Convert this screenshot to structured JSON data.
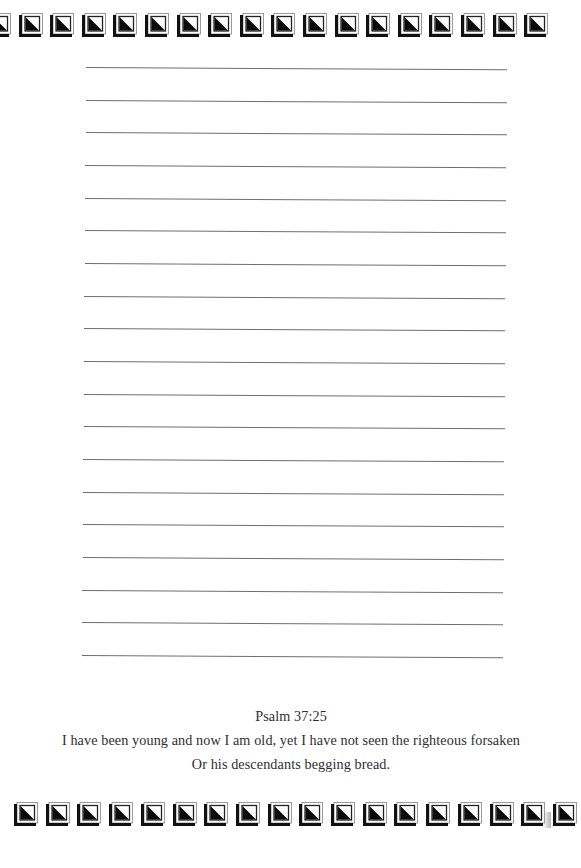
{
  "page": {
    "type": "lined-journal-page",
    "background": "#ffffff",
    "rule_color": "#6e6e6e",
    "text_color": "#2e2e2e"
  },
  "border": {
    "top_tiles": 18,
    "bottom_tiles": 18,
    "tile_icon": "square-with-black-triangle-icon"
  },
  "ruled_lines": {
    "count": 19
  },
  "verse": {
    "reference": "Psalm 37:25",
    "line1": "I have been young and now I am old, yet I have not seen the righteous forsaken",
    "line2": "Or his descendants begging bread."
  }
}
